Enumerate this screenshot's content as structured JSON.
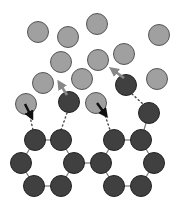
{
  "diagram": {
    "width": 190,
    "height": 207,
    "colors": {
      "light_atom_fill": "#a0a0a0",
      "light_atom_stroke": "#555555",
      "dark_atom_fill": "#404040",
      "dark_atom_stroke": "#222222",
      "bond": "#777777",
      "dark_arrow": "#111111",
      "gray_arrow": "#888888",
      "dotted": "#444444"
    },
    "atom_radius": 10.5,
    "light_atoms": [
      [
        38,
        32
      ],
      [
        68,
        37
      ],
      [
        97,
        24
      ],
      [
        159,
        35
      ],
      [
        61,
        62
      ],
      [
        98,
        60
      ],
      [
        124,
        54
      ],
      [
        43,
        83
      ],
      [
        82,
        79
      ],
      [
        157,
        79
      ],
      [
        26,
        104
      ],
      [
        96,
        103
      ]
    ],
    "dark_atoms": [
      [
        69,
        102
      ],
      [
        126,
        85
      ],
      [
        149,
        113
      ],
      [
        35,
        140
      ],
      [
        61,
        140
      ],
      [
        21,
        163
      ],
      [
        74,
        163
      ],
      [
        34,
        186
      ],
      [
        61,
        186
      ],
      [
        114,
        140
      ],
      [
        141,
        140
      ],
      [
        101,
        163
      ],
      [
        154,
        163
      ],
      [
        114,
        186
      ],
      [
        141,
        186
      ]
    ],
    "bonds": [
      [
        [
          35,
          140
        ],
        [
          61,
          140
        ]
      ],
      [
        [
          61,
          140
        ],
        [
          74,
          163
        ]
      ],
      [
        [
          74,
          163
        ],
        [
          61,
          186
        ]
      ],
      [
        [
          61,
          186
        ],
        [
          34,
          186
        ]
      ],
      [
        [
          34,
          186
        ],
        [
          21,
          163
        ]
      ],
      [
        [
          21,
          163
        ],
        [
          35,
          140
        ]
      ],
      [
        [
          74,
          163
        ],
        [
          101,
          163
        ]
      ],
      [
        [
          114,
          140
        ],
        [
          141,
          140
        ]
      ],
      [
        [
          141,
          140
        ],
        [
          154,
          163
        ]
      ],
      [
        [
          154,
          163
        ],
        [
          141,
          186
        ]
      ],
      [
        [
          141,
          186
        ],
        [
          114,
          186
        ]
      ],
      [
        [
          114,
          186
        ],
        [
          101,
          163
        ]
      ],
      [
        [
          101,
          163
        ],
        [
          114,
          140
        ]
      ],
      [
        [
          141,
          140
        ],
        [
          149,
          113
        ]
      ]
    ],
    "dotted_links": [
      [
        [
          29,
          112
        ],
        [
          33,
          130
        ]
      ],
      [
        [
          67,
          113
        ],
        [
          61,
          130
        ]
      ],
      [
        [
          104,
          112
        ],
        [
          110,
          130
        ]
      ],
      [
        [
          132,
          94
        ],
        [
          143,
          104
        ]
      ]
    ],
    "dark_arrows": [
      [
        [
          25,
          104
        ],
        [
          31,
          116
        ]
      ],
      [
        [
          97,
          103
        ],
        [
          105,
          114
        ]
      ]
    ],
    "gray_arrows": [
      [
        [
          67,
          95
        ],
        [
          60,
          84
        ]
      ],
      [
        [
          124,
          78
        ],
        [
          113,
          70
        ]
      ]
    ]
  }
}
